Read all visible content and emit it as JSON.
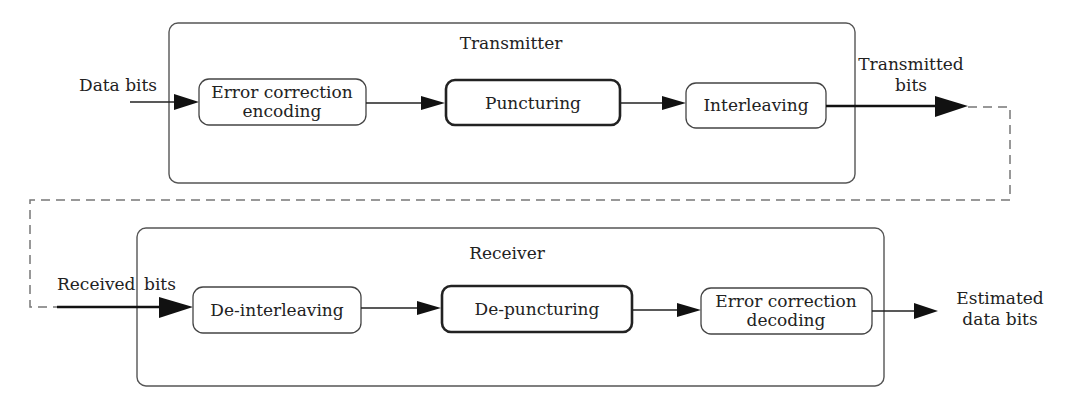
{
  "transmitter": {
    "title": "Transmitter",
    "blocks": [
      {
        "line1": "Error correction",
        "line2": "encoding"
      },
      {
        "label": "Puncturing"
      },
      {
        "label": "Interleaving"
      }
    ]
  },
  "receiver": {
    "title": "Receiver",
    "blocks": [
      {
        "label": "De-interleaving"
      },
      {
        "label": "De-puncturing"
      },
      {
        "line1": "Error correction",
        "line2": "decoding"
      }
    ]
  },
  "signals": {
    "data_bits": "Data bits",
    "transmitted_bits_line1": "Transmitted",
    "transmitted_bits_line2": "bits",
    "received_bits_word1": "Received",
    "received_bits_word2": "bits",
    "estimated_line1": "Estimated",
    "estimated_line2": "data bits"
  }
}
